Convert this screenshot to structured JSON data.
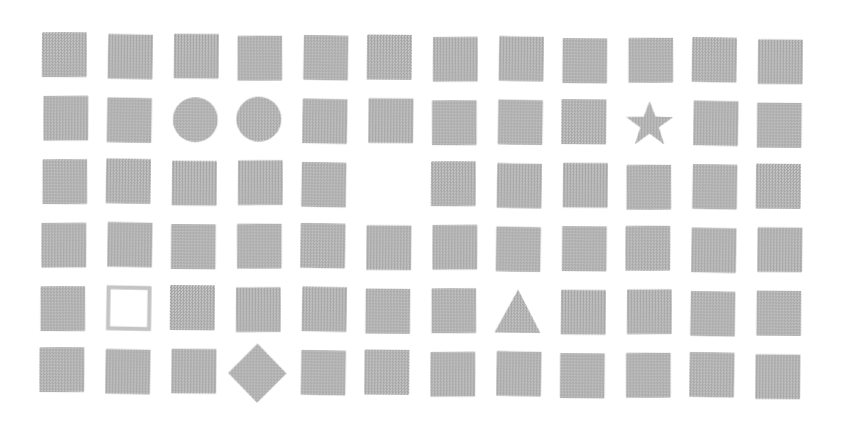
{
  "canvas": {
    "width": 842,
    "height": 446,
    "background": "#ffffff"
  },
  "grid": {
    "rows": 6,
    "cols": 12,
    "cell_size": 45,
    "col_gap": 20,
    "row_gap": 18,
    "offset_x": 43,
    "offset_y": 33,
    "skew_deg": 0.45,
    "cells": [
      [
        "square",
        "square",
        "square",
        "square",
        "square",
        "square",
        "square",
        "square",
        "square",
        "square",
        "square",
        "square"
      ],
      [
        "square",
        "square",
        "circle",
        "circle",
        "square",
        "square",
        "square",
        "square",
        "square",
        "star",
        "square",
        "square"
      ],
      [
        "square",
        "square",
        "square",
        "square",
        "square",
        "empty",
        "square",
        "square",
        "square",
        "square",
        "square",
        "square"
      ],
      [
        "square",
        "square",
        "square",
        "square",
        "square",
        "square",
        "square",
        "square",
        "square",
        "square",
        "square",
        "square"
      ],
      [
        "square",
        "outline-square",
        "square",
        "square",
        "square",
        "square",
        "square",
        "triangle",
        "square",
        "square",
        "square",
        "square"
      ],
      [
        "square",
        "square",
        "square",
        "diamond",
        "square",
        "square",
        "square",
        "square",
        "square",
        "square",
        "square",
        "square"
      ]
    ]
  },
  "shapes": {
    "fill": "#c6c6c6",
    "dot": "#a5a5a5",
    "outline_border": "#c4c4c4",
    "outline_fill": "#ffffff"
  },
  "shape_counts": {
    "square": 65,
    "circle": 2,
    "star": 1,
    "outline-square": 1,
    "triangle": 1,
    "diamond": 1,
    "empty": 1
  }
}
